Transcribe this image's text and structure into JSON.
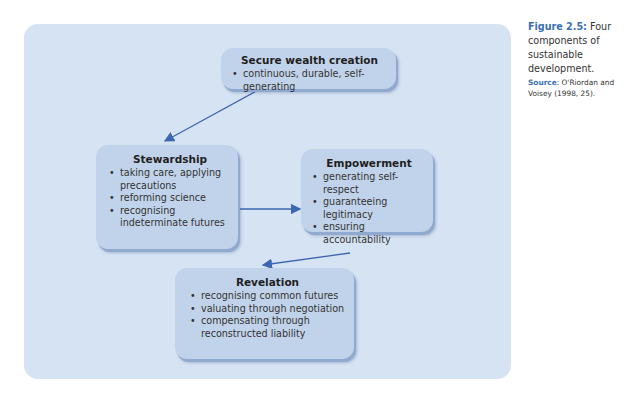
{
  "diagram": {
    "boxes": {
      "wealth": {
        "title": "Secure wealth creation",
        "items": [
          "continuous, durable, self-generating"
        ]
      },
      "stewardship": {
        "title": "Stewardship",
        "items": [
          "taking care, applying precautions",
          "reforming science",
          "recognising indeterminate futures"
        ]
      },
      "empowerment": {
        "title": "Empowerment",
        "items": [
          "generating self-respect",
          "guaranteeing legitimacy",
          "ensuring accountability"
        ]
      },
      "revelation": {
        "title": "Revelation",
        "items": [
          "recognising common futures",
          "valuating through negotiation",
          "compensating through reconstructed liability"
        ]
      }
    },
    "arrows": [
      {
        "from": "wealth",
        "to": "stewardship"
      },
      {
        "from": "stewardship",
        "to": "empowerment"
      },
      {
        "from": "empowerment",
        "to": "revelation"
      }
    ],
    "colors": {
      "panel": "#d6e3f3",
      "box": "#c1d3ea",
      "arrow": "#3d67b0",
      "caption_accent": "#3a70b4"
    }
  },
  "caption": {
    "label": "Figure 2.5:",
    "text": " Four components of sustainable development.",
    "source_label": "Source",
    "source_text": ": O'Riordan and Voisey (1998, 25)."
  }
}
